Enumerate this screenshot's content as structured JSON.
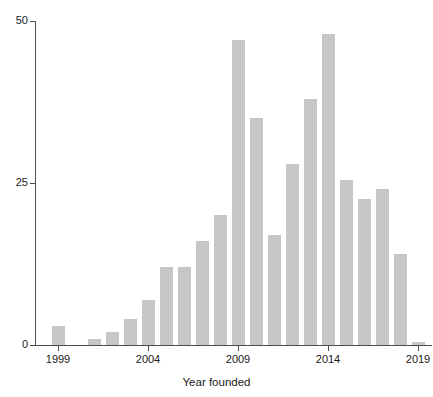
{
  "chart_data": {
    "type": "bar",
    "title": "",
    "xlabel": "Year founded",
    "ylabel": "",
    "categories": [
      "1999",
      "2000",
      "2001",
      "2002",
      "2003",
      "2004",
      "2005",
      "2006",
      "2007",
      "2008",
      "2009",
      "2010",
      "2011",
      "2012",
      "2013",
      "2014",
      "2015",
      "2016",
      "2017",
      "2018",
      "2019"
    ],
    "values": [
      3,
      0,
      1,
      2,
      4,
      7,
      12,
      12,
      16,
      20,
      47,
      35,
      17,
      28,
      38,
      48,
      25.5,
      22.5,
      24,
      14,
      0.5
    ],
    "ylim": [
      0,
      50
    ],
    "xlim": [
      1998.5,
      2019.5
    ],
    "y_ticks": [
      "0",
      "25",
      "50"
    ],
    "y_tick_values": [
      0,
      25,
      50
    ],
    "x_ticks": [
      "1999",
      "2004",
      "2009",
      "2014",
      "2019"
    ],
    "x_tick_values": [
      1999,
      2004,
      2009,
      2014,
      2019
    ],
    "grid": false,
    "legend": null,
    "bar_color": "#c6c6c6",
    "axis_color": "#4d4d4d",
    "text_color": "#1a1a1a",
    "background": "#ffffff"
  },
  "axes": {
    "x_title": "Year founded"
  }
}
